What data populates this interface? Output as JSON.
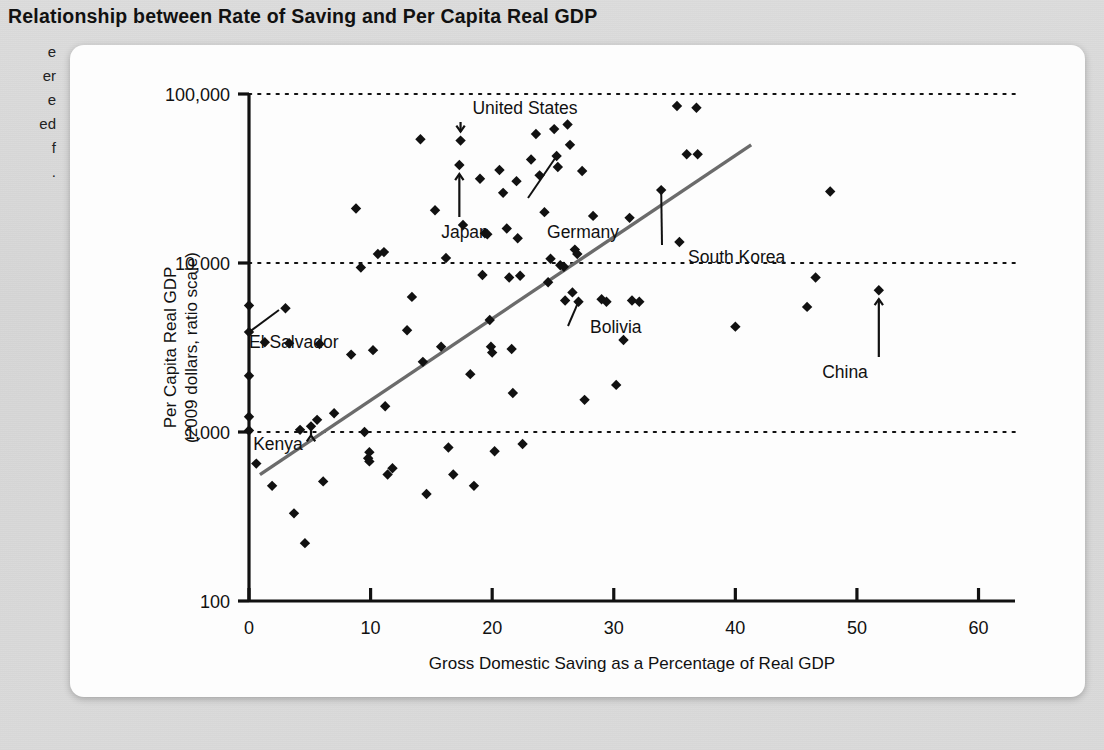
{
  "figure": {
    "title": "Relationship between Rate of Saving and Per Capita Real GDP"
  },
  "margin_note": {
    "lines": [
      "e",
      "er",
      "e",
      "ed",
      "f",
      "."
    ]
  },
  "chart_data": {
    "type": "scatter",
    "title": "Relationship between Rate of Saving and Per Capita Real GDP",
    "xlabel": "Gross Domestic Saving as a Percentage of Real GDP",
    "ylabel": "Per Capita Real GDP\n(2009 dollars, ratio scale)",
    "ylabel_line1": "Per Capita Real GDP",
    "ylabel_line2": "(2009 dollars, ratio scale)",
    "yscale": "log",
    "xlim": [
      0,
      63
    ],
    "ylim": [
      100,
      100000
    ],
    "xticks": [
      0,
      10,
      20,
      30,
      40,
      50,
      60
    ],
    "xtick_labels": [
      "0",
      "10",
      "20",
      "30",
      "40",
      "50",
      "60"
    ],
    "yticks": [
      100,
      1000,
      10000,
      100000
    ],
    "ytick_labels": [
      "100",
      "1,000",
      "10,000",
      "100,000"
    ],
    "grid": "horizontal-dotted at 1,000 / 10,000 / 100,000",
    "marker": "filled diamond",
    "marker_color": "#111111",
    "trendline": {
      "label": "regression line",
      "color": "#6b6b6b",
      "x_start": 0.9,
      "y_start": 560,
      "x_end": 41.3,
      "y_end": 50000
    },
    "points": [
      {
        "x": 0.0,
        "y": 5600
      },
      {
        "x": 0.0,
        "y": 3900
      },
      {
        "x": 0.0,
        "y": 2150
      },
      {
        "x": 0.0,
        "y": 1230
      },
      {
        "x": 0.0,
        "y": 1020
      },
      {
        "x": 0.6,
        "y": 650
      },
      {
        "x": 1.3,
        "y": 3400
      },
      {
        "x": 1.9,
        "y": 480
      },
      {
        "x": 3.0,
        "y": 5400
      },
      {
        "x": 3.3,
        "y": 3350
      },
      {
        "x": 3.7,
        "y": 330
      },
      {
        "x": 4.2,
        "y": 1030
      },
      {
        "x": 4.6,
        "y": 220
      },
      {
        "x": 5.1,
        "y": 1080
      },
      {
        "x": 5.6,
        "y": 1180
      },
      {
        "x": 5.8,
        "y": 3320
      },
      {
        "x": 6.1,
        "y": 510
      },
      {
        "x": 7.0,
        "y": 1290
      },
      {
        "x": 8.4,
        "y": 2870
      },
      {
        "x": 8.8,
        "y": 21000
      },
      {
        "x": 9.2,
        "y": 9400
      },
      {
        "x": 9.5,
        "y": 1000
      },
      {
        "x": 9.8,
        "y": 700
      },
      {
        "x": 9.9,
        "y": 760
      },
      {
        "x": 9.9,
        "y": 670
      },
      {
        "x": 10.2,
        "y": 3050
      },
      {
        "x": 10.6,
        "y": 11300
      },
      {
        "x": 11.1,
        "y": 11600
      },
      {
        "x": 11.2,
        "y": 1420
      },
      {
        "x": 11.4,
        "y": 560
      },
      {
        "x": 11.8,
        "y": 610
      },
      {
        "x": 13.0,
        "y": 4000
      },
      {
        "x": 13.4,
        "y": 6300
      },
      {
        "x": 14.1,
        "y": 54000
      },
      {
        "x": 14.3,
        "y": 2600
      },
      {
        "x": 14.6,
        "y": 430
      },
      {
        "x": 15.3,
        "y": 20500
      },
      {
        "x": 15.8,
        "y": 3200
      },
      {
        "x": 16.2,
        "y": 10700
      },
      {
        "x": 16.4,
        "y": 810
      },
      {
        "x": 16.8,
        "y": 560
      },
      {
        "x": 17.3,
        "y": 38000
      },
      {
        "x": 17.4,
        "y": 53000
      },
      {
        "x": 17.6,
        "y": 16800
      },
      {
        "x": 18.2,
        "y": 2200
      },
      {
        "x": 18.5,
        "y": 480
      },
      {
        "x": 19.0,
        "y": 31500
      },
      {
        "x": 19.2,
        "y": 8500
      },
      {
        "x": 19.4,
        "y": 15000
      },
      {
        "x": 19.6,
        "y": 14800
      },
      {
        "x": 19.8,
        "y": 4600
      },
      {
        "x": 19.9,
        "y": 3200
      },
      {
        "x": 20.0,
        "y": 2950
      },
      {
        "x": 20.2,
        "y": 770
      },
      {
        "x": 20.6,
        "y": 35500
      },
      {
        "x": 20.9,
        "y": 26000
      },
      {
        "x": 21.2,
        "y": 16000
      },
      {
        "x": 21.4,
        "y": 8200
      },
      {
        "x": 21.6,
        "y": 3100
      },
      {
        "x": 21.7,
        "y": 1700
      },
      {
        "x": 22.0,
        "y": 30500
      },
      {
        "x": 22.1,
        "y": 14000
      },
      {
        "x": 22.3,
        "y": 8400
      },
      {
        "x": 22.5,
        "y": 850
      },
      {
        "x": 23.2,
        "y": 41000
      },
      {
        "x": 23.6,
        "y": 58000
      },
      {
        "x": 23.9,
        "y": 33000
      },
      {
        "x": 24.3,
        "y": 20000
      },
      {
        "x": 24.6,
        "y": 7700
      },
      {
        "x": 24.8,
        "y": 10600
      },
      {
        "x": 25.1,
        "y": 62000
      },
      {
        "x": 25.3,
        "y": 43000
      },
      {
        "x": 25.4,
        "y": 37000
      },
      {
        "x": 25.6,
        "y": 9700
      },
      {
        "x": 25.9,
        "y": 9500
      },
      {
        "x": 26.0,
        "y": 6000
      },
      {
        "x": 26.2,
        "y": 66000
      },
      {
        "x": 26.4,
        "y": 50000
      },
      {
        "x": 26.6,
        "y": 6700
      },
      {
        "x": 26.8,
        "y": 12000
      },
      {
        "x": 27.0,
        "y": 11300
      },
      {
        "x": 27.1,
        "y": 5900
      },
      {
        "x": 27.4,
        "y": 35000
      },
      {
        "x": 27.6,
        "y": 1550
      },
      {
        "x": 28.3,
        "y": 19000
      },
      {
        "x": 29.0,
        "y": 6100
      },
      {
        "x": 29.4,
        "y": 5900
      },
      {
        "x": 30.2,
        "y": 1900
      },
      {
        "x": 30.8,
        "y": 3500
      },
      {
        "x": 31.3,
        "y": 18500
      },
      {
        "x": 31.5,
        "y": 6000
      },
      {
        "x": 32.1,
        "y": 5900
      },
      {
        "x": 33.9,
        "y": 27000
      },
      {
        "x": 35.2,
        "y": 85000
      },
      {
        "x": 35.4,
        "y": 13300
      },
      {
        "x": 36.0,
        "y": 44000
      },
      {
        "x": 36.8,
        "y": 83000
      },
      {
        "x": 36.9,
        "y": 44000
      },
      {
        "x": 40.0,
        "y": 4200
      },
      {
        "x": 45.9,
        "y": 5500
      },
      {
        "x": 46.6,
        "y": 8200
      },
      {
        "x": 47.8,
        "y": 26500
      },
      {
        "x": 51.8,
        "y": 6900
      }
    ],
    "annotations": [
      {
        "label": "United States",
        "x": 17.4,
        "y": 53000,
        "style": "down-arrow"
      },
      {
        "label": "Japan",
        "x": 17.3,
        "y": 38000,
        "style": "up-arrow"
      },
      {
        "label": "Germany",
        "x": 25.3,
        "y": 43000,
        "style": "leader-line"
      },
      {
        "label": "South Korea",
        "x": 33.9,
        "y": 27000,
        "style": "leader-line"
      },
      {
        "label": "Bolivia",
        "x": 27.1,
        "y": 5900,
        "style": "leader-line"
      },
      {
        "label": "El Salvador",
        "x": 0.0,
        "y": 3900,
        "style": "leader-line"
      },
      {
        "label": "Kenya",
        "x": 5.1,
        "y": 1080,
        "style": "down-arrow"
      },
      {
        "label": "China",
        "x": 51.8,
        "y": 6900,
        "style": "up-arrow"
      }
    ]
  },
  "colors": {
    "page_background": "#d9d9d9",
    "card_background": "#fdfdfd",
    "ink": "#111111",
    "trendline": "#6b6b6b"
  }
}
